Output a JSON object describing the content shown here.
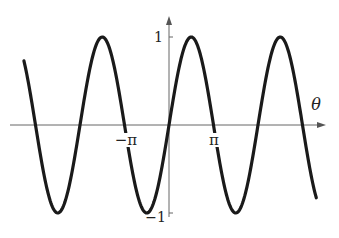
{
  "chart_data": {
    "type": "line",
    "title": "",
    "function": "sin(theta)",
    "xlabel": "θ",
    "ylabel": "",
    "xlim_in_pi": [
      -3.26,
      3.31
    ],
    "ylim": [
      -1,
      1
    ],
    "x_ticks": [
      {
        "value_in_pi": -1,
        "label": "−π"
      },
      {
        "value_in_pi": 1,
        "label": "π"
      }
    ],
    "y_ticks": [
      {
        "value": 1,
        "label": "1"
      },
      {
        "value": -1,
        "label": "−1"
      }
    ],
    "grid": false,
    "legend": null,
    "series": [
      {
        "name": "sin θ",
        "color": "#1a1a1a",
        "x_start_in_pi": -3.26,
        "x_end_in_pi": 3.31,
        "samples": 400
      }
    ]
  },
  "layout": {
    "origin_px": [
      169,
      125
    ],
    "px_per_pi": 44.5,
    "px_per_unit_y": 88,
    "x_axis_px": [
      10,
      325
    ],
    "y_axis_px": [
      217,
      17
    ]
  },
  "labels": {
    "theta": "θ",
    "neg_pi": "−π",
    "pi": "π",
    "one": "1",
    "neg_one": "−1"
  }
}
